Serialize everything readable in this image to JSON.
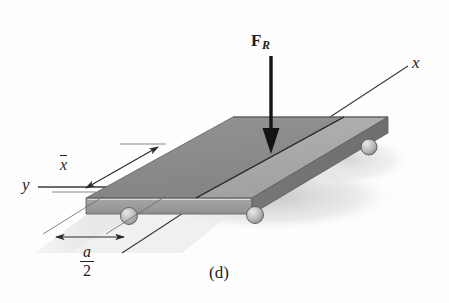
{
  "figure": {
    "caption": "(d)",
    "axes": {
      "x_label": "x",
      "y_label": "y"
    },
    "force": {
      "label_base": "F",
      "label_subscript": "R",
      "direction": "downward",
      "description": "resultant force arrow pointing down onto plate"
    },
    "dimensions": [
      {
        "name": "x-bar",
        "label": "x",
        "overbar": true,
        "description": "distance from y axis to line of action of FR"
      },
      {
        "name": "a-over-2",
        "numerator": "a",
        "denominator": "2",
        "description": "half width a/2 measured along y direction"
      }
    ],
    "supports": {
      "type": "ball-roller",
      "count": 3
    },
    "colors": {
      "plate_top_dark": "#8d8d8d",
      "plate_top_light": "#aaaaaa",
      "plate_front_face": "#9a9a9a",
      "plate_edge_dark": "#6f6f6f",
      "ground_shade": "#e3e3e3",
      "shadow": "#cfcfcf",
      "line": "#2a2a2a",
      "arrow": "#141414",
      "background": "#fdfdfd"
    }
  }
}
